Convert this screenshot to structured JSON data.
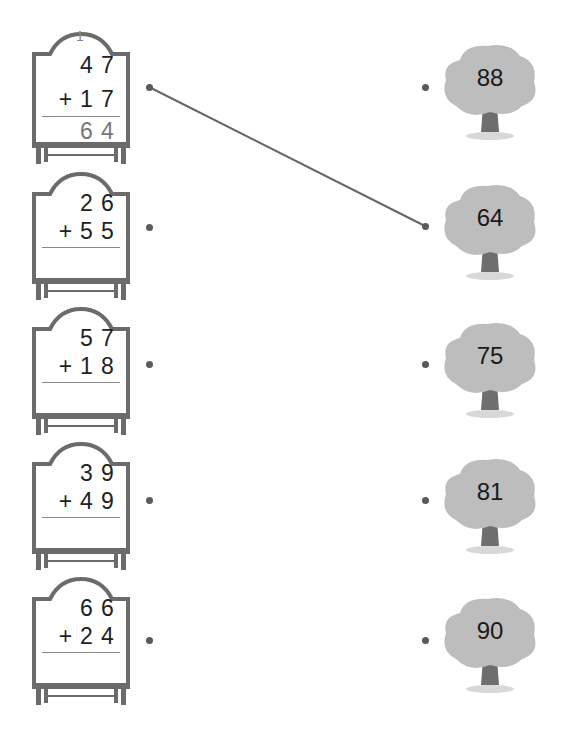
{
  "problems": [
    {
      "top": "4 7",
      "top_digits": [
        "4",
        "7"
      ],
      "bottom_digits": [
        "1",
        "7"
      ],
      "operator": "+",
      "carry": "1",
      "answer_digits": [
        "6",
        "4"
      ]
    },
    {
      "top_digits": [
        "2",
        "6"
      ],
      "bottom_digits": [
        "5",
        "5"
      ],
      "operator": "+",
      "carry": "",
      "answer_digits": [
        "",
        ""
      ]
    },
    {
      "top_digits": [
        "5",
        "7"
      ],
      "bottom_digits": [
        "1",
        "8"
      ],
      "operator": "+",
      "carry": "",
      "answer_digits": [
        "",
        ""
      ]
    },
    {
      "top_digits": [
        "3",
        "9"
      ],
      "bottom_digits": [
        "4",
        "9"
      ],
      "operator": "+",
      "carry": "",
      "answer_digits": [
        "",
        ""
      ]
    },
    {
      "top_digits": [
        "6",
        "6"
      ],
      "bottom_digits": [
        "2",
        "4"
      ],
      "operator": "+",
      "carry": "",
      "answer_digits": [
        "",
        ""
      ]
    }
  ],
  "trees": [
    {
      "value": "88"
    },
    {
      "value": "64"
    },
    {
      "value": "75"
    },
    {
      "value": "81"
    },
    {
      "value": "90"
    }
  ],
  "connections": [
    {
      "from_problem": 0,
      "to_tree": 1
    }
  ],
  "colors": {
    "board_frame": "#6b6b6b",
    "tree_foliage": "#bdbdbd",
    "tree_trunk": "#6e6e6e",
    "line": "#666666",
    "dot": "#5a5a5a"
  }
}
